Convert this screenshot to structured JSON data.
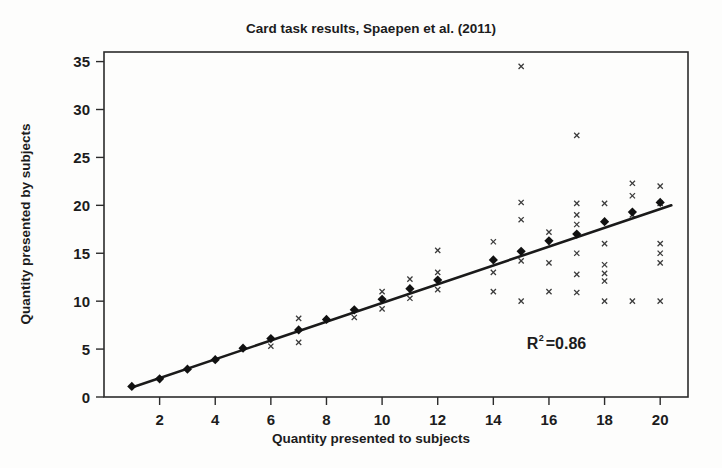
{
  "figure": {
    "width": 722,
    "height": 468,
    "background": "#fdfdfc",
    "ink_color": "#1a1a1a"
  },
  "chart_data": {
    "type": "scatter",
    "title": "Card task results, Spaepen et al. (2011)",
    "xlabel": "Quantity presented to subjects",
    "ylabel": "Quantity presented by subjects",
    "xlim": [
      0,
      21
    ],
    "ylim": [
      0,
      36
    ],
    "xticks": [
      2,
      4,
      6,
      8,
      10,
      12,
      14,
      16,
      18,
      20
    ],
    "yticks": [
      0,
      5,
      10,
      15,
      20,
      25,
      30,
      35
    ],
    "grid": false,
    "legend": null,
    "annotations": [
      {
        "name": "r-squared",
        "text_prefix": "R",
        "text_superscript": "2",
        "text_suffix": "=0.86",
        "x": 15.2,
        "y": 5.0
      }
    ],
    "series": [
      {
        "name": "Mean response per quantity",
        "marker": "diamond",
        "color": "#111111",
        "x": [
          1,
          2,
          3,
          4,
          5,
          6,
          7,
          8,
          9,
          10,
          11,
          12,
          14,
          15,
          16,
          17,
          18,
          19,
          20
        ],
        "y": [
          1.1,
          1.9,
          2.9,
          3.9,
          5.1,
          6.1,
          7.0,
          8.1,
          9.1,
          10.2,
          11.3,
          12.2,
          14.3,
          15.2,
          16.3,
          17.0,
          18.3,
          19.3,
          20.3
        ]
      },
      {
        "name": "Individual subject responses",
        "marker": "x",
        "color": "#3a3a3a",
        "points": [
          [
            6,
            5.3
          ],
          [
            7,
            8.2
          ],
          [
            7,
            5.7
          ],
          [
            9,
            8.3
          ],
          [
            10,
            11.0
          ],
          [
            10,
            9.2
          ],
          [
            11,
            12.3
          ],
          [
            11,
            10.3
          ],
          [
            12,
            15.3
          ],
          [
            12,
            13.0
          ],
          [
            12,
            11.2
          ],
          [
            14,
            16.2
          ],
          [
            14,
            13.0
          ],
          [
            14,
            11.0
          ],
          [
            15,
            34.5
          ],
          [
            15,
            20.3
          ],
          [
            15,
            18.5
          ],
          [
            15,
            14.2
          ],
          [
            15,
            10.0
          ],
          [
            16,
            17.2
          ],
          [
            16,
            14.0
          ],
          [
            16,
            11.0
          ],
          [
            17,
            27.3
          ],
          [
            17,
            20.2
          ],
          [
            17,
            19.0
          ],
          [
            17,
            18.0
          ],
          [
            17,
            15.0
          ],
          [
            17,
            12.8
          ],
          [
            17,
            10.9
          ],
          [
            18,
            20.2
          ],
          [
            18,
            16.0
          ],
          [
            18,
            13.8
          ],
          [
            18,
            12.9
          ],
          [
            18,
            12.1
          ],
          [
            18,
            10.0
          ],
          [
            19,
            22.3
          ],
          [
            19,
            21.0
          ],
          [
            19,
            19.0
          ],
          [
            19,
            10.0
          ],
          [
            20,
            22.0
          ],
          [
            20,
            20.2
          ],
          [
            20,
            16.0
          ],
          [
            20,
            15.0
          ],
          [
            20,
            14.0
          ],
          [
            20,
            10.0
          ]
        ]
      }
    ],
    "trendline": {
      "name": "Linear fit",
      "x_start": 1.0,
      "y_start": 1.0,
      "x_end": 20.4,
      "y_end": 20.0,
      "color": "#1a1a1a"
    }
  }
}
